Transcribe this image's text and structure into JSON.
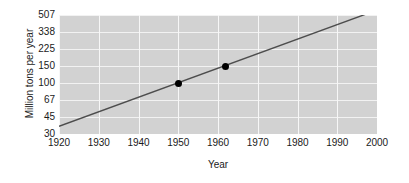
{
  "chart_data": {
    "type": "line",
    "title": "",
    "xlabel": "Year",
    "ylabel": "Million tons per year",
    "x_ticks": [
      1920,
      1930,
      1940,
      1950,
      1960,
      1970,
      1980,
      1990,
      2000
    ],
    "x_tick_labels": [
      "1920",
      "1930",
      "1940",
      "1950",
      "1960",
      "1970",
      "1980",
      "1990",
      "2000"
    ],
    "xlim": [
      1920,
      2000
    ],
    "y_scale": "log",
    "y_ticks": [
      30,
      45,
      67,
      100,
      150,
      225,
      338,
      507
    ],
    "y_tick_labels": [
      "30",
      "45",
      "67",
      "100",
      "150",
      "225",
      "338",
      "507"
    ],
    "ylim": [
      30,
      507
    ],
    "grid": true,
    "legend": "none",
    "series": [
      {
        "name": "trend",
        "kind": "line",
        "x": [
          1920,
          2000
        ],
        "values": [
          36,
          570
        ]
      },
      {
        "name": "data points",
        "kind": "scatter",
        "x": [
          1950,
          1962
        ],
        "values": [
          100,
          150
        ]
      }
    ],
    "colors": {
      "plot_background": "#d2d2d2",
      "gridline": "#f2f2f2",
      "trend_line": "#4d4d4d",
      "marker": "#000000",
      "text": "#1a1a1a"
    }
  }
}
